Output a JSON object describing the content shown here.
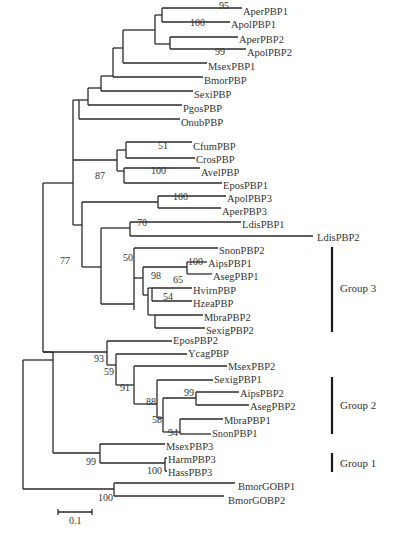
{
  "figure": {
    "type": "phylogenetic-tree",
    "line_color": "#2a2a2a",
    "text_color": "#333333"
  },
  "leaves": [
    {
      "name": "AperPBP1",
      "x": 243,
      "y": 11
    },
    {
      "name": "ApolPBP1",
      "x": 231,
      "y": 24
    },
    {
      "name": "AperPBP2",
      "x": 239,
      "y": 39
    },
    {
      "name": "ApolPBP2",
      "x": 247,
      "y": 52
    },
    {
      "name": "MsexPBP1",
      "x": 208,
      "y": 66
    },
    {
      "name": "BmorPBP",
      "x": 204,
      "y": 80
    },
    {
      "name": "SexiPBP",
      "x": 194,
      "y": 94
    },
    {
      "name": "PgosPBP",
      "x": 183,
      "y": 108
    },
    {
      "name": "OnubPBP",
      "x": 181,
      "y": 122
    },
    {
      "name": "CfumPBP",
      "x": 193,
      "y": 146
    },
    {
      "name": "CrosPBP",
      "x": 196,
      "y": 159
    },
    {
      "name": "AvelPBP",
      "x": 201,
      "y": 172
    },
    {
      "name": "EposPBP1",
      "x": 223,
      "y": 185
    },
    {
      "name": "ApolPBP3",
      "x": 227,
      "y": 198
    },
    {
      "name": "AperPBP3",
      "x": 222,
      "y": 211
    },
    {
      "name": "LdisPBP1",
      "x": 242,
      "y": 224
    },
    {
      "name": "LdisPBP2",
      "x": 317,
      "y": 237
    },
    {
      "name": "SnonPBP2",
      "x": 219,
      "y": 250
    },
    {
      "name": "AipsPBP1",
      "x": 208,
      "y": 263
    },
    {
      "name": "AsegPBP1",
      "x": 213,
      "y": 276
    },
    {
      "name": "HvirnPBP",
      "x": 193,
      "y": 290
    },
    {
      "name": "HzeaPBP",
      "x": 193,
      "y": 303
    },
    {
      "name": "MbraPBP2",
      "x": 204,
      "y": 317
    },
    {
      "name": "SexigPBP2",
      "x": 206,
      "y": 330
    },
    {
      "name": "EposPBP2",
      "x": 173,
      "y": 340
    },
    {
      "name": "YcagPBP",
      "x": 188,
      "y": 353
    },
    {
      "name": "MsexPBP2",
      "x": 228,
      "y": 366
    },
    {
      "name": "SexigPBP1",
      "x": 214,
      "y": 379
    },
    {
      "name": "AipsPBP2",
      "x": 240,
      "y": 393
    },
    {
      "name": "AsegPBP2",
      "x": 250,
      "y": 406
    },
    {
      "name": "MbraPBP1",
      "x": 224,
      "y": 420
    },
    {
      "name": "SnonPBP1",
      "x": 212,
      "y": 433
    },
    {
      "name": "MsexPBP3",
      "x": 166,
      "y": 446
    },
    {
      "name": "HarmPBP3",
      "x": 168,
      "y": 459
    },
    {
      "name": "HassPBP3",
      "x": 168,
      "y": 472
    },
    {
      "name": "BmorGOBP1",
      "x": 238,
      "y": 486
    },
    {
      "name": "BmorGOBP2",
      "x": 228,
      "y": 500
    }
  ],
  "bootstrap": [
    {
      "value": "95",
      "x": 219,
      "y": 9
    },
    {
      "value": "100",
      "x": 190,
      "y": 26
    },
    {
      "value": "99",
      "x": 215,
      "y": 55
    },
    {
      "value": "51",
      "x": 158,
      "y": 149
    },
    {
      "value": "100",
      "x": 151,
      "y": 174
    },
    {
      "value": "87",
      "x": 95,
      "y": 179
    },
    {
      "value": "100",
      "x": 173,
      "y": 200
    },
    {
      "value": "70",
      "x": 137,
      "y": 226
    },
    {
      "value": "50",
      "x": 123,
      "y": 261
    },
    {
      "value": "100",
      "x": 188,
      "y": 265
    },
    {
      "value": "77",
      "x": 60,
      "y": 264
    },
    {
      "value": "98",
      "x": 151,
      "y": 279
    },
    {
      "value": "65",
      "x": 173,
      "y": 283
    },
    {
      "value": "54",
      "x": 163,
      "y": 300
    },
    {
      "value": "93",
      "x": 94,
      "y": 362
    },
    {
      "value": "59",
      "x": 104,
      "y": 375
    },
    {
      "value": "91",
      "x": 120,
      "y": 391
    },
    {
      "value": "99",
      "x": 184,
      "y": 396
    },
    {
      "value": "88",
      "x": 146,
      "y": 405
    },
    {
      "value": "58",
      "x": 152,
      "y": 423
    },
    {
      "value": "94",
      "x": 168,
      "y": 436
    },
    {
      "value": "99",
      "x": 86,
      "y": 465
    },
    {
      "value": "100",
      "x": 147,
      "y": 474
    },
    {
      "value": "100",
      "x": 98,
      "y": 501
    }
  ],
  "groups": [
    {
      "label": "Group 3",
      "bar_x": 332,
      "y1": 247,
      "y2": 332,
      "label_x": 340,
      "label_y": 292
    },
    {
      "label": "Group 2",
      "bar_x": 332,
      "y1": 377,
      "y2": 434,
      "label_x": 340,
      "label_y": 409
    },
    {
      "label": "Group 1",
      "bar_x": 332,
      "y1": 453,
      "y2": 472,
      "label_x": 340,
      "label_y": 467
    }
  ],
  "scale_bar": {
    "label": "0.1",
    "x1": 58,
    "x2": 92,
    "y": 512,
    "label_x": 69,
    "label_y": 524
  },
  "branches": [
    [
      78,
      9,
      78,
      59
    ],
    [
      78,
      9,
      80,
      9
    ],
    [
      80,
      9,
      80,
      79
    ],
    [
      80,
      79,
      88,
      79
    ],
    [
      88,
      9,
      88,
      71
    ],
    [
      88,
      9,
      104,
      9
    ],
    [
      104,
      9,
      104,
      30
    ],
    [
      104,
      30,
      153,
      30
    ],
    [
      104,
      71,
      118,
      71
    ],
    [
      104,
      71,
      104,
      9
    ],
    [
      153,
      30,
      153,
      15
    ],
    [
      153,
      15,
      153,
      44
    ],
    [
      153,
      15,
      159,
      15
    ],
    [
      159,
      15,
      159,
      19
    ],
    [
      159,
      8,
      159,
      22
    ],
    [
      159,
      8,
      242,
      8
    ],
    [
      159,
      22,
      230,
      22
    ],
    [
      153,
      44,
      169,
      44
    ],
    [
      169,
      37,
      169,
      49
    ],
    [
      169,
      37,
      238,
      37
    ],
    [
      169,
      49,
      246,
      49
    ],
    [
      146,
      30,
      146,
      63
    ],
    [
      146,
      63,
      207,
      63
    ],
    [
      128,
      43,
      128,
      77
    ],
    [
      128,
      43,
      146,
      43
    ],
    [
      128,
      77,
      203,
      77
    ],
    [
      118,
      60,
      118,
      91
    ],
    [
      118,
      60,
      128,
      60
    ],
    [
      118,
      91,
      193,
      91
    ],
    [
      118,
      71,
      118,
      60
    ],
    [
      104,
      59,
      104,
      105
    ],
    [
      104,
      105,
      182,
      105
    ],
    [
      88,
      79,
      88,
      119
    ],
    [
      88,
      119,
      180,
      119
    ],
    [
      78,
      59,
      104,
      59
    ],
    [
      99,
      59,
      99,
      183
    ],
    [
      99,
      183,
      115,
      183
    ],
    [
      99,
      59,
      78,
      59
    ]
  ]
}
